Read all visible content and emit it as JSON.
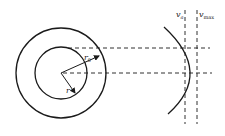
{
  "diagram": {
    "labels": {
      "v_a": "v",
      "v_a_sub": "a",
      "v_max": "v",
      "v_max_sub": "max",
      "r0": "r",
      "r0_sub": "0",
      "r": "r"
    },
    "colors": {
      "stroke": "#1a1a1a",
      "background": "#ffffff"
    }
  }
}
